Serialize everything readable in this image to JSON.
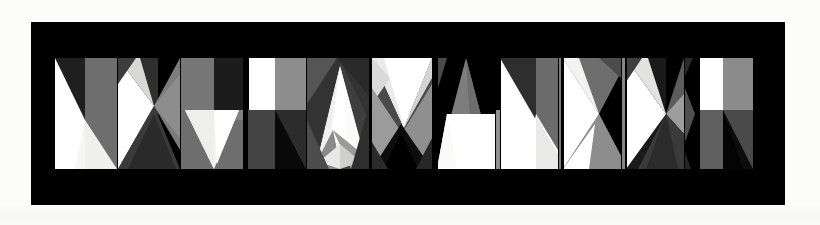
{
  "artwork": {
    "title": "NKYPAVANKKP",
    "medium": "geometric grayscale letterform composition",
    "background_color": "#fcfcfa",
    "panel_color": "#000000",
    "panel": {
      "x": 31,
      "y": 22,
      "width": 754,
      "height": 183
    },
    "strip": {
      "x": 24,
      "y": 36,
      "width": 706,
      "height": 111
    },
    "palette": {
      "black": "#000000",
      "near_black": "#141414",
      "dark_gray": "#2b2b2b",
      "charcoal": "#3b3b3b",
      "mid_dark_gray": "#4d4d4d",
      "mid_gray": "#5e5e5e",
      "gray": "#6e6e6e",
      "light_mid_gray": "#808080",
      "light_gray": "#9a9a9a",
      "pale_gray": "#bdbdbd",
      "near_white": "#e4e4e2",
      "off_white": "#f2f2f0",
      "white": "#ffffff"
    },
    "glyph_count": 11,
    "glyphs": [
      {
        "index": 1,
        "letter": "N",
        "width": 62,
        "name": "glyph-n-1"
      },
      {
        "index": 2,
        "letter": "K",
        "width": 62,
        "name": "glyph-k-2"
      },
      {
        "index": 3,
        "letter": "Y",
        "width": 62,
        "name": "glyph-y-3"
      },
      {
        "index": 4,
        "letter": "P",
        "width": 62,
        "name": "glyph-p-4"
      },
      {
        "index": 5,
        "letter": "A",
        "width": 62,
        "name": "glyph-a-5"
      },
      {
        "index": 6,
        "letter": "V",
        "width": 62,
        "name": "glyph-v-6"
      },
      {
        "index": 7,
        "letter": "A",
        "width": 62,
        "name": "glyph-a-7"
      },
      {
        "index": 8,
        "letter": "N",
        "width": 62,
        "name": "glyph-n-8"
      },
      {
        "index": 9,
        "letter": "X",
        "width": 62,
        "name": "glyph-x-9"
      },
      {
        "index": 10,
        "letter": "K",
        "width": 62,
        "name": "glyph-k-10"
      },
      {
        "index": 11,
        "letter": "P",
        "width": 68,
        "name": "glyph-p-11"
      }
    ]
  }
}
